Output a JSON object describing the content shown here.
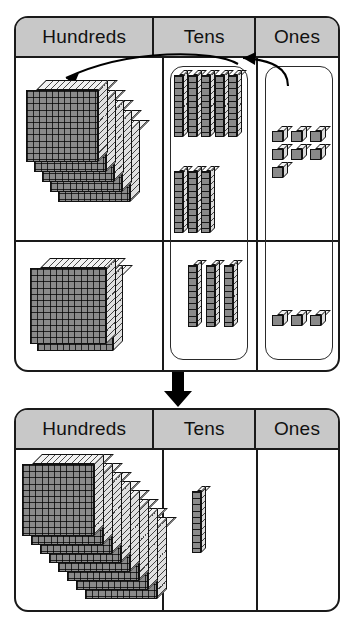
{
  "diagram": {
    "colors": {
      "header_fill": "#c8c8c8",
      "outline": "#1a1a1a",
      "block_face": "#8a8a8a",
      "block_top": "#f2f2f2",
      "block_side": "#dcdcdc",
      "arrow": "#000000"
    }
  },
  "top_table": {
    "headers": {
      "hundreds": "Hundreds",
      "tens": "Tens",
      "ones": "Ones"
    },
    "rows": [
      {
        "name": "addend-row-1",
        "hundreds_flats": 5,
        "tens_rods": 5,
        "ones_units": 7
      },
      {
        "name": "addend-row-2",
        "hundreds_flats": 2,
        "tens_rods": 3,
        "ones_units": 3
      }
    ],
    "second_row_tens_rods_in_upper_group": 3
  },
  "bottom_table": {
    "headers": {
      "hundreds": "Hundreds",
      "tens": "Tens",
      "ones": "Ones"
    },
    "rows": [
      {
        "name": "sum-row",
        "hundreds_flats": 8,
        "tens_rods": 1,
        "ones_units": 0
      }
    ]
  },
  "arrows": {
    "ones_to_tens": "regroup-ones-to-tens-arrow",
    "tens_to_hundreds": "regroup-tens-to-hundreds-arrow",
    "result": "result-down-arrow"
  }
}
